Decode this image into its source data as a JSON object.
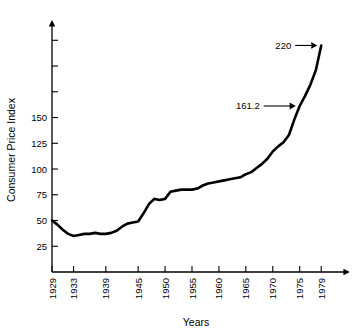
{
  "chart_data": {
    "type": "line",
    "title": "",
    "xlabel": "Years",
    "ylabel": "Consumer Price Index",
    "xlim": [
      1929,
      1981
    ],
    "ylim": [
      0,
      235
    ],
    "grid": false,
    "legend": "none",
    "x_tick_labels": [
      "1929",
      "1933",
      "1939",
      "1945",
      "1950",
      "1955",
      "1960",
      "1965",
      "1970",
      "1975",
      "1979"
    ],
    "x_tick_values": [
      1929,
      1933,
      1939,
      1945,
      1950,
      1955,
      1960,
      1965,
      1970,
      1975,
      1979
    ],
    "y_tick_labels": [
      "25",
      "50",
      "75",
      "100",
      "125",
      "150",
      "",
      "",
      ""
    ],
    "y_tick_values": [
      25,
      50,
      75,
      100,
      125,
      150,
      175,
      200,
      225
    ],
    "series": [
      {
        "name": "Consumer Price Index",
        "x": [
          1929,
          1930,
          1931,
          1932,
          1933,
          1934,
          1935,
          1936,
          1937,
          1938,
          1939,
          1940,
          1941,
          1942,
          1943,
          1944,
          1945,
          1946,
          1947,
          1948,
          1949,
          1950,
          1951,
          1952,
          1953,
          1954,
          1955,
          1956,
          1957,
          1958,
          1959,
          1960,
          1961,
          1962,
          1963,
          1964,
          1965,
          1966,
          1967,
          1968,
          1969,
          1970,
          1971,
          1972,
          1973,
          1974,
          1975,
          1976,
          1977,
          1978,
          1979
        ],
        "values": [
          50,
          46,
          41,
          37,
          35,
          36,
          37,
          37,
          38,
          37,
          37,
          38,
          40,
          44,
          47,
          48,
          49,
          57,
          66,
          71,
          70,
          71,
          78,
          79,
          80,
          80,
          80,
          81,
          84,
          86,
          87,
          88,
          89,
          90,
          91,
          92,
          95,
          97,
          101,
          105,
          110,
          117,
          122,
          126,
          133,
          148,
          161.2,
          171,
          182,
          196,
          220
        ]
      }
    ],
    "annotations": [
      {
        "label": "220",
        "x": 1979,
        "y": 220
      },
      {
        "label": "161.2",
        "x": 1975,
        "y": 161.2
      }
    ]
  }
}
